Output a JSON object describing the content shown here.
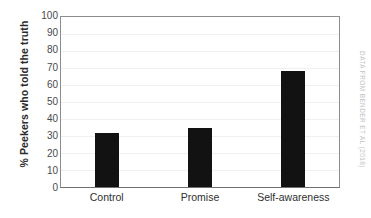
{
  "chart_data": {
    "type": "bar",
    "title": "",
    "xlabel": "",
    "ylabel": "% Peekers who told the truth",
    "categories": [
      "Control",
      "Promise",
      "Self-awareness"
    ],
    "values": [
      32,
      35,
      68
    ],
    "ylim": [
      0,
      100
    ],
    "yticks": [
      0,
      10,
      20,
      30,
      40,
      50,
      60,
      70,
      80,
      90,
      100
    ],
    "ytick_labels": [
      "0",
      "10",
      "20",
      "30",
      "40",
      "50",
      "60",
      "70",
      "80",
      "90",
      "100"
    ],
    "grid": true,
    "legend": false,
    "bar_color": "#121212",
    "grid_color": "#f0f0f0",
    "axis_color": "#8c8c8c"
  },
  "credit": {
    "text": "DATA FROM BENDER ET AL (2018)",
    "color": "#c2c2c2"
  }
}
